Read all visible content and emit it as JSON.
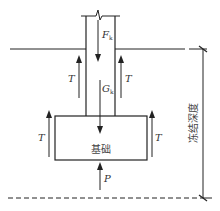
{
  "diagram": {
    "type": "frost-heave-force-diagram",
    "labels": {
      "dead_load": "F",
      "dead_load_sub": "k",
      "self_weight": "G",
      "self_weight_sub": "k",
      "tangential_frost_force": "T",
      "base_reaction": "P",
      "foundation": "基础",
      "frost_depth": "冻结深度"
    },
    "colors": {
      "line": "#222222",
      "text": "#333333",
      "background": "#ffffff"
    }
  }
}
